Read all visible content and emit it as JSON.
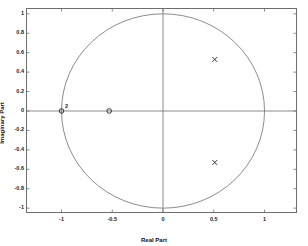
{
  "chart_data": {
    "type": "scatter",
    "title": "",
    "xlabel": "Real Part",
    "ylabel": "Imaginary Part",
    "xlim": [
      -1.35,
      1.32
    ],
    "ylim": [
      -1.05,
      1.06
    ],
    "grid": false,
    "legend": null,
    "aspect": "equal",
    "xticks": [
      -1,
      -0.5,
      0,
      0.5,
      1
    ],
    "xticklabels": [
      "-1",
      "-0.5",
      "0",
      "0.5",
      "1"
    ],
    "yticks": [
      1,
      0.8,
      0.6,
      0.4,
      0.2,
      0,
      -0.2,
      -0.4,
      -0.6,
      -0.8,
      -1
    ],
    "yticklabels": [
      "1",
      "0.8",
      "0.6",
      "0.4",
      "0.2",
      "0",
      "-0.2",
      "-0.4",
      "-0.6",
      "-0.8",
      "-1"
    ],
    "reference_shapes": [
      {
        "name": "unit-circle",
        "shape": "circle",
        "center": [
          0,
          0
        ],
        "radius": 1,
        "color": "#6e6e6e"
      },
      {
        "name": "real-axis",
        "shape": "hline",
        "y": 0,
        "color": "#6e6e6e"
      },
      {
        "name": "imaginary-axis",
        "shape": "vline",
        "x": 0,
        "color": "#6e6e6e"
      }
    ],
    "series": [
      {
        "name": "zeros",
        "marker": "o",
        "color": "#333333",
        "points": [
          {
            "x": -1,
            "y": 0,
            "multiplicity": 2,
            "label": "2"
          },
          {
            "x": -0.53,
            "y": 0,
            "multiplicity": 1,
            "label": ""
          }
        ]
      },
      {
        "name": "poles",
        "marker": "x",
        "color": "#333333",
        "points": [
          {
            "x": 0.51,
            "y": 0.53,
            "multiplicity": 1,
            "label": ""
          },
          {
            "x": 0.51,
            "y": -0.53,
            "multiplicity": 1,
            "label": ""
          }
        ]
      }
    ]
  },
  "axes": {
    "xlabel": "Real Part",
    "ylabel": "Imaginary Part"
  },
  "colors": {
    "frame": "#6e6e6e",
    "marker": "#333333",
    "text": "#111111",
    "background": "#ffffff"
  }
}
